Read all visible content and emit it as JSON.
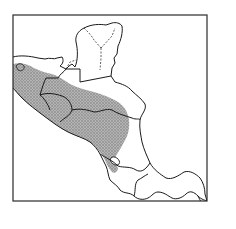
{
  "map": {
    "title": "",
    "region": "Central America",
    "frame": {
      "x": 13,
      "y": 15,
      "width": 194,
      "height": 186
    },
    "colors": {
      "background": "#ffffff",
      "land": "#ffffff",
      "coastline": "#1a1a1a",
      "border": "#1a1a1a",
      "range_fill": "#a8a8a8",
      "range_stipple": "#6e6e6e",
      "frame": "#2a2a2a"
    },
    "legend": [],
    "labels": [],
    "layers": [
      {
        "id": "coastline",
        "style": "solid"
      },
      {
        "id": "national-borders",
        "style": "solid"
      },
      {
        "id": "state-borders-yucatan",
        "style": "dashed"
      },
      {
        "id": "species-range",
        "style": "stippled-gray"
      }
    ]
  }
}
